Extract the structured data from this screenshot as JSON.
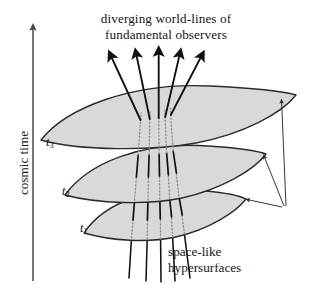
{
  "figure": {
    "domain": "diagram",
    "title_caption": {
      "line1": "diverging world-lines of",
      "line2": "fundamental observers"
    },
    "side_caption": {
      "line1": "space-like",
      "line2": "hypersurfaces"
    },
    "axis": {
      "label": "cosmic time",
      "direction": "upward",
      "arrow": "up-arrow-icon"
    },
    "time_slices": [
      {
        "id": "t1",
        "label": "t",
        "subscript": "1"
      },
      {
        "id": "t2",
        "label": "t",
        "subscript": "2"
      },
      {
        "id": "t3",
        "label": "t",
        "subscript": "3"
      }
    ],
    "worldlines": {
      "count": 5,
      "style": "solid above surface, dotted below surface",
      "arrowheads": 5,
      "description": "five diverging world-lines of fundamental observers"
    },
    "pointers": {
      "count": 3,
      "description": "three leader lines from the space-like hypersurfaces caption to each surface edge"
    },
    "colors": {
      "surface_fill": "#d9d9d9",
      "surface_stroke": "#2b2b2b",
      "worldline": "#111111",
      "hidden_worldline": "#8d8d8d",
      "axis": "#4a4a4a",
      "text": "#161616",
      "background": "#ffffff"
    }
  }
}
